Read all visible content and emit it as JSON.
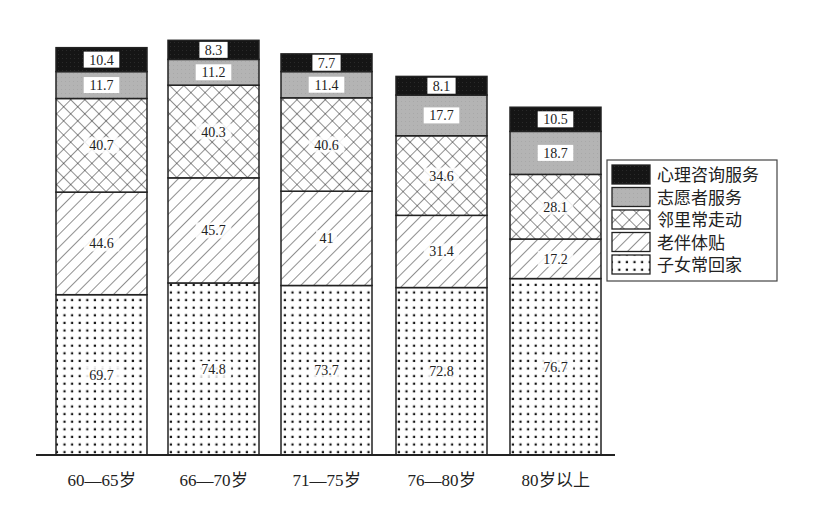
{
  "chart_data": {
    "type": "bar",
    "stacked": true,
    "title": "",
    "xlabel": "",
    "ylabel": "",
    "grid": false,
    "y_axis_visible": false,
    "legend_position": "right",
    "categories": [
      "60—65岁",
      "66—70岁",
      "71—75岁",
      "76—80岁",
      "80岁以上"
    ],
    "series": [
      {
        "name": "子女常回家",
        "pattern": "dots",
        "color": "#ffffff",
        "values": [
          69.7,
          74.8,
          73.7,
          72.8,
          76.7
        ]
      },
      {
        "name": "老伴体贴",
        "pattern": "diagonal-hatch",
        "color": "#ffffff",
        "values": [
          44.6,
          45.7,
          41,
          31.4,
          17.2
        ]
      },
      {
        "name": "邻里常走动",
        "pattern": "crosshatch",
        "color": "#ffffff",
        "values": [
          40.7,
          40.3,
          40.6,
          34.6,
          28.1
        ]
      },
      {
        "name": "志愿者服务",
        "pattern": "solid-gray",
        "color": "#b4b4b4",
        "values": [
          11.7,
          11.2,
          11.4,
          17.7,
          18.7
        ]
      },
      {
        "name": "心理咨询服务",
        "pattern": "solid-black",
        "color": "#1a1a1a",
        "values": [
          10.4,
          8.3,
          7.7,
          8.1,
          10.5
        ]
      }
    ],
    "legend_order": [
      "心理咨询服务",
      "志愿者服务",
      "邻里常走动",
      "老伴体贴",
      "子女常回家"
    ],
    "data_labels": true
  },
  "layout": {
    "baseline_y": 455,
    "px_per_unit": 2.3,
    "bar_width": 91,
    "bar_x": [
      56,
      168,
      281,
      396,
      510
    ],
    "axis_x_start": 36,
    "axis_x_end": 615,
    "legend": {
      "x": 607,
      "y": 160,
      "w": 170,
      "h": 121,
      "row_h": 22.5
    }
  },
  "caption": {
    "visible": "partially clipped at bottom edge"
  }
}
